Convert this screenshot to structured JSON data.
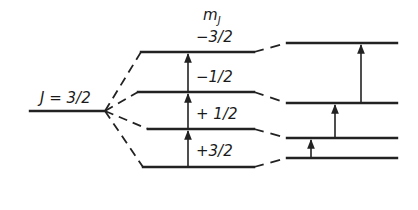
{
  "diagram": {
    "type": "energy-level-splitting",
    "colors": {
      "line": "#222222",
      "background": "#ffffff"
    },
    "parent_level": {
      "label": "J = 3/2",
      "y": 111,
      "x1": 30,
      "x2": 105
    },
    "column_header": "mJ",
    "header_main": "m",
    "header_sub": "J",
    "middle_levels": [
      {
        "mj": "-3/2",
        "label": "−3/2",
        "y": 52
      },
      {
        "mj": "-1/2",
        "label": "−1/2",
        "y": 92
      },
      {
        "mj": "+1/2",
        "label": "+ 1/2",
        "y": 129
      },
      {
        "mj": "+3/2",
        "label": "+3/2",
        "y": 167
      }
    ],
    "right_levels": [
      {
        "mj": "-3/2",
        "y": 43
      },
      {
        "mj": "-1/2",
        "y": 103
      },
      {
        "mj": "+1/2",
        "y": 138
      },
      {
        "mj": "+3/2",
        "y": 158
      }
    ],
    "middle_arrows": [
      {
        "from": "+3/2",
        "to": "+1/2"
      },
      {
        "from": "+1/2",
        "to": "-1/2"
      },
      {
        "from": "-1/2",
        "to": "-3/2"
      }
    ],
    "right_arrows": [
      {
        "from": "+3/2",
        "to": "+1/2",
        "x": 311
      },
      {
        "from": "+1/2",
        "to": "-1/2",
        "x": 335
      },
      {
        "from": "-1/2",
        "to": "-3/2",
        "x": 361
      }
    ]
  }
}
